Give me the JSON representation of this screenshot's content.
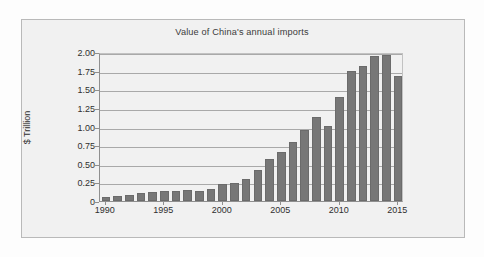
{
  "chart_data": {
    "type": "bar",
    "title": "Value of China's annual imports",
    "xlabel": "",
    "ylabel": "$ Trillion",
    "categories": [
      1990,
      1991,
      1992,
      1993,
      1994,
      1995,
      1996,
      1997,
      1998,
      1999,
      2000,
      2001,
      2002,
      2003,
      2004,
      2005,
      2006,
      2007,
      2008,
      2009,
      2010,
      2011,
      2012,
      2013,
      2014,
      2015
    ],
    "values": [
      0.053,
      0.064,
      0.081,
      0.104,
      0.116,
      0.132,
      0.139,
      0.142,
      0.14,
      0.166,
      0.225,
      0.244,
      0.295,
      0.413,
      0.561,
      0.66,
      0.792,
      0.956,
      1.133,
      1.006,
      1.396,
      1.743,
      1.818,
      1.95,
      1.959,
      1.682
    ],
    "ylim": [
      0,
      2.0
    ],
    "ytick_values": [
      0,
      0.25,
      0.5,
      0.75,
      1.0,
      1.25,
      1.5,
      1.75,
      2.0
    ],
    "ytick_labels": [
      "0",
      "0.25",
      "0.50",
      "0.75",
      "1.00",
      "1.25",
      "1.50",
      "1.75",
      "2.00"
    ],
    "xtick_values": [
      1990,
      1995,
      2000,
      2005,
      2010,
      2015
    ],
    "xtick_labels": [
      "1990",
      "1995",
      "2000",
      "2005",
      "2010",
      "2015"
    ],
    "grid": true,
    "legend": false,
    "bar_color": "#777777",
    "plot_background": "#f1f1f1",
    "axis_color": "#8f8f8f",
    "gridline_color": "#a9a9a9",
    "text_color": "#2f2f2f"
  }
}
